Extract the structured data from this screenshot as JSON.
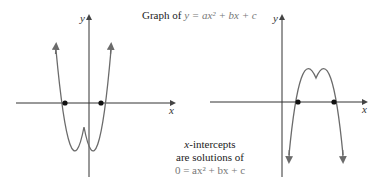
{
  "title": {
    "prefix": "Graph of ",
    "equation": "y = ax² + bx + c"
  },
  "note": {
    "line1_var": "x",
    "line1_rest": "-intercepts",
    "line2": "are solutions of",
    "line3": "0 = ax² + bx + c"
  },
  "left_graph": {
    "x_axis_label": "x",
    "y_axis_label": "y",
    "description": "Upward-opening parabola (a > 0) crossing x-axis at two points"
  },
  "right_graph": {
    "x_axis_label": "x",
    "y_axis_label": "y",
    "description": "Downward-opening parabola (a < 0) crossing x-axis at two points"
  },
  "colors": {
    "axis": "#333333",
    "curve": "#6b6b6b",
    "point": "#111111",
    "math_text": "#777777"
  }
}
